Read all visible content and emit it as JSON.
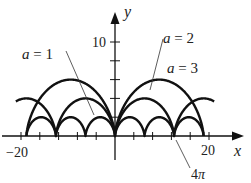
{
  "chart_data": {
    "type": "line",
    "title": "",
    "xlabel": "x",
    "ylabel": "y",
    "xlim": [
      -22,
      24
    ],
    "ylim": [
      -2.5,
      14
    ],
    "x_tick_labels": [
      {
        "value": -20,
        "label": "−20"
      },
      {
        "value": 20,
        "label": "20"
      }
    ],
    "x_ticks": [
      -20,
      -16,
      -12,
      -8,
      -4,
      4,
      8,
      12,
      16,
      20
    ],
    "y_tick_labels": [
      {
        "value": 10,
        "label": "10"
      }
    ],
    "y_ticks": [
      2,
      4,
      6,
      8,
      10
    ],
    "grid": false,
    "series": [
      {
        "name": "a = 1",
        "a": 1,
        "equation": "x = a(t - sin t), y = a(1 - cos t)",
        "t_range": [
          -18.85,
          18.85
        ],
        "arch_width": 6.283,
        "max_height": 2
      },
      {
        "name": "a = 2",
        "a": 2,
        "equation": "x = a(t - sin t), y = a(1 - cos t)",
        "t_range": [
          -10,
          10
        ],
        "arch_width": 12.566,
        "max_height": 4
      },
      {
        "name": "a = 3",
        "a": 3,
        "equation": "x = a(t - sin t), y = a(1 - cos t)",
        "t_range": [
          -6.283,
          6.283
        ],
        "arch_width": 18.85,
        "max_height": 6
      }
    ],
    "annotations": [
      {
        "text": "a = 1",
        "points_to": "a = 1 curve"
      },
      {
        "text": "a = 2",
        "points_to": "a = 2 curve"
      },
      {
        "text": "a = 3",
        "points_to": "a = 3 curve"
      },
      {
        "text": "4π",
        "points_to": "x = 4π"
      }
    ]
  },
  "labels": {
    "x_axis": "x",
    "y_axis": "y",
    "tick_neg20": "−20",
    "tick_20": "20",
    "tick_10": "10",
    "a1": "a = 1",
    "a2": "a = 2",
    "a3": "a = 3",
    "four_pi": "4π"
  },
  "colors": {
    "curve": "#111111",
    "axis": "#111111",
    "text": "#222222"
  }
}
